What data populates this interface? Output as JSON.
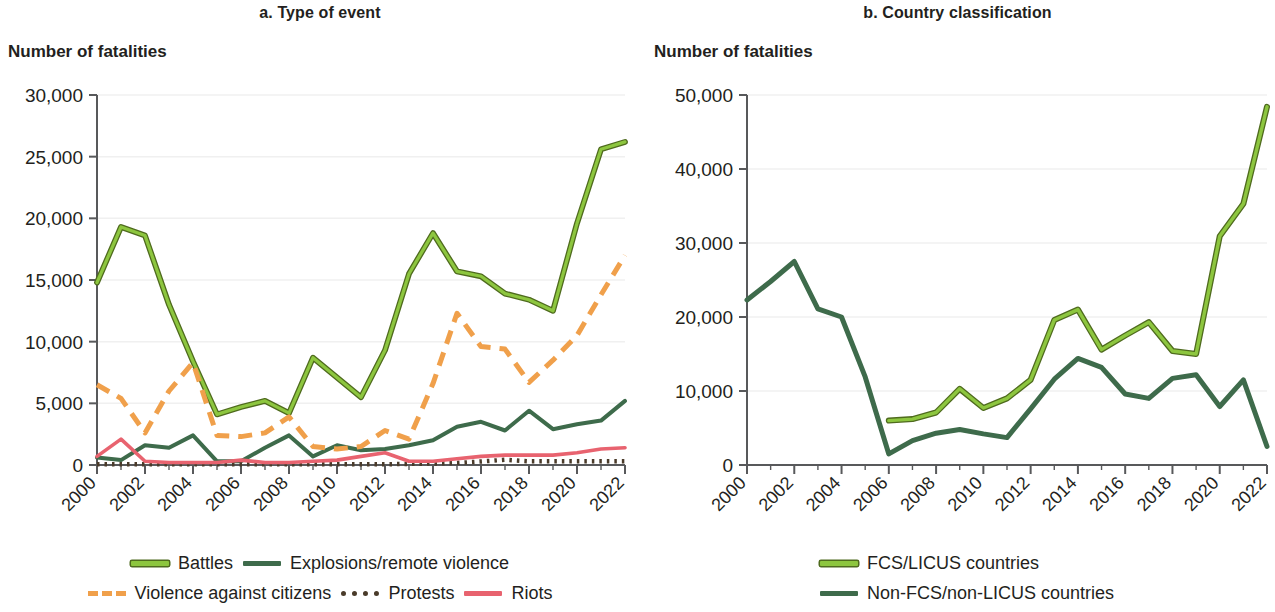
{
  "colors": {
    "battles": "#8DC63F",
    "battles_outline": "#4F6B1E",
    "explosions": "#3E6B4B",
    "violence_citizens": "#F0A04B",
    "protests": "#4A3B2A",
    "riots": "#E8636F",
    "fcs": "#8DC63F",
    "fcs_outline": "#4F6B1E",
    "nonfcs": "#3E6B4B",
    "axis": "#58595B",
    "grid": "#F0F0F0",
    "text": "#231f20"
  },
  "panel_a": {
    "title": "a. Type of event",
    "axis_title": "Number of fatalities",
    "legend": [
      {
        "label": "Battles",
        "style": "solid-outlined",
        "color_key": "battles"
      },
      {
        "label": "Explosions/remote violence",
        "style": "solid",
        "color_key": "explosions"
      },
      {
        "label": "Violence against citizens",
        "style": "dashed",
        "color_key": "violence_citizens"
      },
      {
        "label": "Protests",
        "style": "dotted",
        "color_key": "protests"
      },
      {
        "label": "Riots",
        "style": "solid",
        "color_key": "riots"
      }
    ]
  },
  "panel_b": {
    "title": "b. Country classification",
    "axis_title": "Number of fatalities",
    "legend": [
      {
        "label": "FCS/LICUS countries",
        "style": "solid-outlined",
        "color_key": "fcs"
      },
      {
        "label": "Non-FCS/non-LICUS countries",
        "style": "solid",
        "color_key": "nonfcs"
      }
    ]
  },
  "chart_data": [
    {
      "type": "line",
      "title": "a. Type of event",
      "xlabel": "",
      "ylabel": "Number of fatalities",
      "x": [
        2000,
        2001,
        2002,
        2003,
        2004,
        2005,
        2006,
        2007,
        2008,
        2009,
        2010,
        2011,
        2012,
        2013,
        2014,
        2015,
        2016,
        2017,
        2018,
        2019,
        2020,
        2021,
        2022
      ],
      "xticks": [
        2000,
        2002,
        2004,
        2006,
        2008,
        2010,
        2012,
        2014,
        2016,
        2018,
        2020,
        2022
      ],
      "ylim": [
        0,
        30000
      ],
      "yticks": [
        0,
        5000,
        10000,
        15000,
        20000,
        25000,
        30000
      ],
      "ytick_labels": [
        "0",
        "5,000",
        "10,000",
        "15,000",
        "20,000",
        "25,000",
        "30,000"
      ],
      "grid": true,
      "legend_position": "bottom",
      "series": [
        {
          "name": "Battles",
          "values": [
            14800,
            19300,
            18600,
            13000,
            8400,
            4100,
            4700,
            5200,
            4200,
            8700,
            7100,
            5500,
            9300,
            15500,
            18800,
            15700,
            15300,
            13900,
            13400,
            12500,
            19600,
            25600,
            26200
          ]
        },
        {
          "name": "Explosions/remote violence",
          "values": [
            600,
            400,
            1600,
            1400,
            2400,
            300,
            300,
            1400,
            2400,
            700,
            1600,
            1200,
            1300,
            1600,
            2000,
            3100,
            3500,
            2800,
            4400,
            2900,
            3300,
            3600,
            5200
          ]
        },
        {
          "name": "Violence against citizens",
          "values": [
            6500,
            5400,
            2600,
            6000,
            8300,
            2400,
            2300,
            2600,
            3900,
            1500,
            1300,
            1500,
            2800,
            2100,
            6600,
            12300,
            9600,
            9400,
            6700,
            8500,
            10500,
            13800,
            17000
          ]
        },
        {
          "name": "Protests",
          "values": [
            60,
            60,
            60,
            60,
            60,
            60,
            60,
            60,
            60,
            60,
            60,
            60,
            60,
            90,
            120,
            160,
            280,
            420,
            300,
            300,
            300,
            300,
            300
          ]
        },
        {
          "name": "Riots",
          "values": [
            700,
            2100,
            300,
            200,
            200,
            200,
            400,
            200,
            200,
            300,
            400,
            700,
            1000,
            300,
            300,
            500,
            700,
            800,
            800,
            800,
            1000,
            1300,
            1400
          ]
        }
      ]
    },
    {
      "type": "line",
      "title": "b. Country classification",
      "xlabel": "",
      "ylabel": "Number of fatalities",
      "x": [
        2000,
        2001,
        2002,
        2003,
        2004,
        2005,
        2006,
        2007,
        2008,
        2009,
        2010,
        2011,
        2012,
        2013,
        2014,
        2015,
        2016,
        2017,
        2018,
        2019,
        2020,
        2021,
        2022
      ],
      "xticks": [
        2000,
        2002,
        2004,
        2006,
        2008,
        2010,
        2012,
        2014,
        2016,
        2018,
        2020,
        2022
      ],
      "ylim": [
        0,
        50000
      ],
      "yticks": [
        0,
        10000,
        20000,
        30000,
        40000,
        50000
      ],
      "ytick_labels": [
        "0",
        "10,000",
        "20,000",
        "30,000",
        "40,000",
        "50,000"
      ],
      "grid": true,
      "legend_position": "bottom",
      "series": [
        {
          "name": "FCS/LICUS countries",
          "values": [
            null,
            null,
            null,
            null,
            null,
            null,
            6000,
            6200,
            7100,
            10300,
            7700,
            9000,
            11500,
            19600,
            21000,
            15600,
            17500,
            19300,
            15400,
            15000,
            30900,
            35300,
            48400
          ]
        },
        {
          "name": "Non-FCS/non-LICUS countries",
          "values": [
            22300,
            24800,
            27500,
            21100,
            20000,
            11900,
            1500,
            3300,
            4300,
            4800,
            4200,
            3700,
            7600,
            11600,
            14400,
            13200,
            9600,
            9000,
            11700,
            12200,
            7900,
            11500,
            2500
          ]
        }
      ]
    }
  ]
}
